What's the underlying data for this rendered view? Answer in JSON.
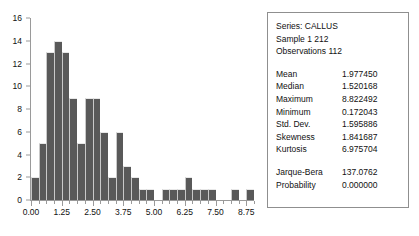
{
  "chart_data": {
    "type": "bar",
    "title": "",
    "xlabel": "",
    "ylabel": "",
    "grid": false,
    "legend": "none",
    "bin_width": 0.3125,
    "x_start": 0.0,
    "xlim": [
      0.0,
      9.0625
    ],
    "ylim": [
      0,
      16
    ],
    "x_ticks_major": [
      0.0,
      1.25,
      2.5,
      3.75,
      5.0,
      6.25,
      7.5,
      8.75
    ],
    "x_tick_labels": [
      "0.00",
      "1.25",
      "2.50",
      "3.75",
      "5.00",
      "6.25",
      "7.50",
      "8.75"
    ],
    "y_ticks": [
      0,
      2,
      4,
      6,
      8,
      10,
      12,
      14,
      16
    ],
    "y_tick_labels": [
      "0",
      "2",
      "4",
      "6",
      "8",
      "10",
      "12",
      "14",
      "16"
    ],
    "bin_centers": [
      0.156,
      0.469,
      0.781,
      1.094,
      1.406,
      1.719,
      2.031,
      2.344,
      2.656,
      2.969,
      3.281,
      3.594,
      3.906,
      4.219,
      4.531,
      4.844,
      5.156,
      5.469,
      5.781,
      6.094,
      6.406,
      6.719,
      7.031,
      7.344,
      7.656,
      7.969,
      8.281,
      8.594,
      8.906
    ],
    "values": [
      2,
      5,
      13,
      14,
      13,
      9,
      5,
      9,
      9,
      6,
      2,
      6,
      3,
      2,
      1,
      1,
      0,
      1,
      1,
      1,
      2,
      1,
      1,
      1,
      0,
      0,
      1,
      0,
      1
    ],
    "bar_color": "#595959"
  },
  "stats": {
    "header_lines": [
      "Series: CALLUS",
      "Sample 1 212",
      "Observations 112"
    ],
    "rows": [
      {
        "key": "Mean",
        "value": "1.977450"
      },
      {
        "key": "Median",
        "value": "1.520168"
      },
      {
        "key": "Maximum",
        "value": "8.822492"
      },
      {
        "key": "Minimum",
        "value": "0.172043"
      },
      {
        "key": "Std. Dev.",
        "value": "1.595886"
      },
      {
        "key": "Skewness",
        "value": "1.841687"
      },
      {
        "key": "Kurtosis",
        "value": "6.975704"
      }
    ],
    "test_rows": [
      {
        "key": "Jarque-Bera",
        "value": "137.0762"
      },
      {
        "key": "Probability",
        "value": "0.000000"
      }
    ]
  }
}
